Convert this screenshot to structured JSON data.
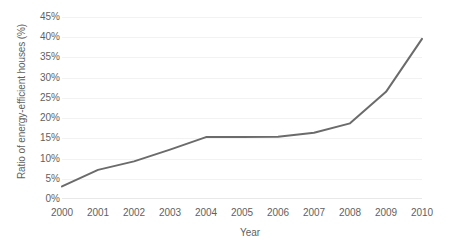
{
  "chart_data": {
    "type": "line",
    "title": "",
    "xlabel": "Year",
    "ylabel": "Ratio of energy-efficient houses (%)",
    "categories": [
      "2000",
      "2001",
      "2002",
      "2003",
      "2004",
      "2005",
      "2006",
      "2007",
      "2008",
      "2009",
      "2010"
    ],
    "x": [
      2000,
      2001,
      2002,
      2003,
      2004,
      2005,
      2006,
      2007,
      2008,
      2009,
      2010
    ],
    "values": [
      3.1,
      7.2,
      9.3,
      12.2,
      15.3,
      15.3,
      15.4,
      16.4,
      18.7,
      26.5,
      39.6
    ],
    "series": [
      {
        "name": "Ratio of energy-efficient houses",
        "values": [
          3.1,
          7.2,
          9.3,
          12.2,
          15.3,
          15.3,
          15.4,
          16.4,
          18.7,
          26.5,
          39.6
        ],
        "color": "#6b6b6b"
      }
    ],
    "ylim": [
      0,
      45
    ],
    "ytick_step": 5,
    "ytick_labels": [
      "0%",
      "5%",
      "10%",
      "15%",
      "20%",
      "25%",
      "30%",
      "35%",
      "40%",
      "45%"
    ],
    "ytick_values": [
      0,
      5,
      10,
      15,
      20,
      25,
      30,
      35,
      40,
      45
    ],
    "xtick_labels": [
      "2000",
      "2001",
      "2002",
      "2003",
      "2004",
      "2005",
      "2006",
      "2007",
      "2008",
      "2009",
      "2010"
    ],
    "grid": true,
    "grid_axis": "y",
    "legend": false,
    "legend_position": "none",
    "markers": false,
    "annotations": []
  },
  "axes": {
    "y_title": "Ratio of energy-efficient houses (%)",
    "x_title": "Year"
  },
  "colors": {
    "line": "#6b6b6b",
    "grid": "#f2f2f2",
    "text": "#5f5f5f",
    "background": "#ffffff"
  },
  "title_remnant": {
    "text": ""
  }
}
